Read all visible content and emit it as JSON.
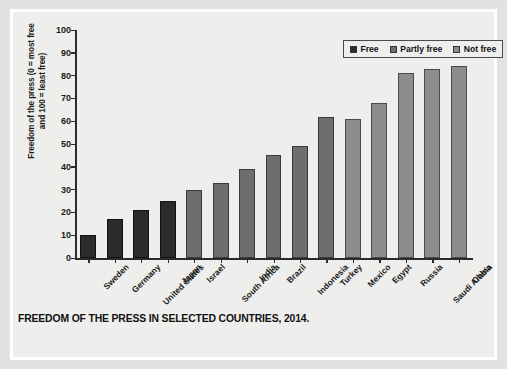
{
  "caption": "FREEDOM OF THE PRESS IN SELECTED COUNTRIES, 2014.",
  "legend": {
    "items": [
      {
        "label": "Free",
        "color": "#2b2b2b",
        "swatch": "free"
      },
      {
        "label": "Partly free",
        "color": "#6e6e6e",
        "swatch": "partly"
      },
      {
        "label": "Not free",
        "color": "#8d8d8d",
        "swatch": "notfree"
      }
    ]
  },
  "chart_data": {
    "type": "bar",
    "title": "FREEDOM OF THE PRESS IN SELECTED COUNTRIES, 2014.",
    "xlabel": "",
    "ylabel": "Freedom of the press (0 = most free and 100 = least free)",
    "ylabel_line1": "Freedom of the press (0 = most free",
    "ylabel_line2": "and 100 = least free)",
    "ylim": [
      0,
      100
    ],
    "yticks": [
      0,
      10,
      20,
      30,
      40,
      50,
      60,
      70,
      80,
      90,
      100
    ],
    "grid": false,
    "legend_position": "top-right",
    "categories": [
      "Sweden",
      "Germany",
      "United States",
      "Japan",
      "Israel",
      "South Africa",
      "India",
      "Brazil",
      "Indonesia",
      "Turkey",
      "Mexico",
      "Egypt",
      "Russia",
      "Saudi Arabia",
      "China"
    ],
    "values": [
      10,
      17,
      21,
      25,
      30,
      33,
      39,
      45,
      49,
      62,
      61,
      68,
      81,
      83,
      84
    ],
    "categories_status": [
      "Free",
      "Free",
      "Free",
      "Free",
      "Partly free",
      "Partly free",
      "Partly free",
      "Partly free",
      "Partly free",
      "Partly free",
      "Not free",
      "Not free",
      "Not free",
      "Not free",
      "Not free"
    ],
    "series": [
      {
        "name": "Freedom of the press score",
        "values": [
          10,
          17,
          21,
          25,
          30,
          33,
          39,
          45,
          49,
          62,
          61,
          68,
          81,
          83,
          84
        ]
      }
    ]
  }
}
